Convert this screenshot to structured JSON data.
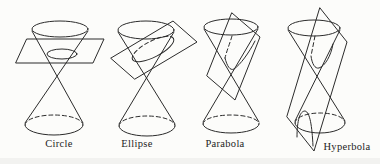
{
  "diagram": {
    "name": "conic-sections",
    "background_color": "#fcfcfa",
    "line_color": "#2b2b2b",
    "label_color": "#1c1c1c",
    "figures": [
      {
        "label": "Circle"
      },
      {
        "label": "Ellipse"
      },
      {
        "label": "Parabola"
      },
      {
        "label": "Hyperbola"
      }
    ]
  }
}
